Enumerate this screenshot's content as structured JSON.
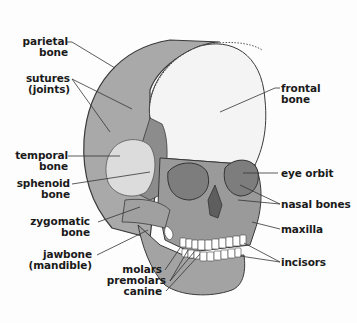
{
  "diagram": {
    "title": "",
    "colors": {
      "parietal": "#a9a9a9",
      "frontal": "#f4f4f4",
      "temporal": "#dcdcdc",
      "sphenoid": "#8c8c8c",
      "face": "#9a9a9a",
      "orbit": "#888888",
      "jaw": "#a3a3a3",
      "teeth": "#ffffff",
      "outline": "#3a3a3a",
      "leader": "#333333",
      "text": "#1a1a1a"
    },
    "labels": {
      "parietal_1": "parietal",
      "parietal_2": "bone",
      "sutures_1": "sutures",
      "sutures_2": "(joints)",
      "frontal_1": "frontal",
      "frontal_2": "bone",
      "temporal_1": "temporal",
      "temporal_2": "bone",
      "sphenoid_1": "sphenoid",
      "sphenoid_2": "bone",
      "eye_orbit": "eye orbit",
      "nasal_bones": "nasal bones",
      "zygomatic_1": "zygomatic",
      "zygomatic_2": "bone",
      "maxilla": "maxilla",
      "jawbone_1": "jawbone",
      "jawbone_2": "(mandible)",
      "molars": "molars",
      "premolars": "premolars",
      "canine": "canine",
      "incisors": "incisors"
    }
  }
}
